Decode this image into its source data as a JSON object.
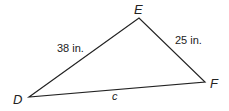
{
  "diagram": {
    "type": "triangle",
    "vertices": [
      {
        "name": "D",
        "x": 29,
        "y": 97,
        "label_x": 13,
        "label_y": 104
      },
      {
        "name": "E",
        "x": 139,
        "y": 18,
        "label_x": 134,
        "label_y": 14
      },
      {
        "name": "F",
        "x": 205,
        "y": 82,
        "label_x": 210,
        "label_y": 88
      }
    ],
    "sides": [
      {
        "name": "DE",
        "label": "38 in.",
        "label_x": 57,
        "label_y": 52
      },
      {
        "name": "EF",
        "label": "25 in.",
        "label_x": 175,
        "label_y": 44
      },
      {
        "name": "DF",
        "label": "c",
        "label_x": 112,
        "label_y": 100
      }
    ],
    "stroke_color": "#222222"
  }
}
